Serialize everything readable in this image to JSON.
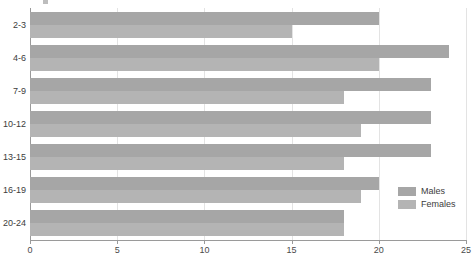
{
  "chart_data": {
    "type": "bar",
    "orientation": "horizontal",
    "title": "",
    "xlabel": "",
    "ylabel": "",
    "categories": [
      "2-3",
      "4-6",
      "7-9",
      "10-12",
      "13-15",
      "16-19",
      "20-24"
    ],
    "series": [
      {
        "name": "Males",
        "color": "#a6a6a6",
        "values": [
          20,
          24,
          23,
          23,
          23,
          20,
          18
        ]
      },
      {
        "name": "Females",
        "color": "#b4b4b4",
        "values": [
          15,
          20,
          18,
          19,
          18,
          19,
          18
        ]
      }
    ],
    "xlim": [
      0,
      25
    ],
    "xticks": [
      0,
      5,
      10,
      15,
      20,
      25
    ],
    "xtick_labels": [
      "0",
      "5",
      "10",
      "15",
      "20",
      "25"
    ],
    "grid": "vertical",
    "legend_position": "inside-right"
  },
  "legend": {
    "entries": [
      {
        "label": "Males"
      },
      {
        "label": "Females"
      }
    ]
  }
}
